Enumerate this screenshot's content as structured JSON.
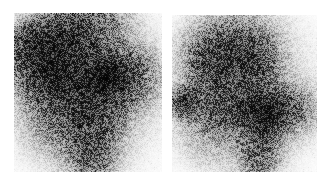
{
  "figure": {
    "kind": "nuclear-medicine-scintigraphy",
    "width": 329,
    "height": 184,
    "background_color": "#ffffff",
    "modality_label": "",
    "caption": ""
  },
  "panels": [
    {
      "id": "panel-left",
      "label": "",
      "view": "left",
      "x": 14,
      "y": 13,
      "width": 148,
      "height": 159,
      "base_color": "#f7f7f7",
      "speckle_color": "#1a1a1a",
      "noise_density": 0.55,
      "grain_size": 1,
      "blobs": [
        {
          "name": "upper-arc-band",
          "cx": 0.34,
          "cy": 0.13,
          "rx": 0.34,
          "ry": 0.16,
          "rot": -22,
          "intensity": 0.82
        },
        {
          "name": "upper-left-rim",
          "cx": 0.16,
          "cy": 0.26,
          "rx": 0.17,
          "ry": 0.22,
          "rot": -35,
          "intensity": 0.62
        },
        {
          "name": "central-mass",
          "cx": 0.47,
          "cy": 0.38,
          "rx": 0.27,
          "ry": 0.23,
          "rot": 10,
          "intensity": 0.74
        },
        {
          "name": "focal-hotspot",
          "cx": 0.62,
          "cy": 0.4,
          "rx": 0.11,
          "ry": 0.1,
          "rot": 0,
          "intensity": 1.0
        },
        {
          "name": "right-lateral-spread",
          "cx": 0.8,
          "cy": 0.4,
          "rx": 0.17,
          "ry": 0.17,
          "rot": 0,
          "intensity": 0.5
        },
        {
          "name": "mid-left-band",
          "cx": 0.22,
          "cy": 0.44,
          "rx": 0.18,
          "ry": 0.16,
          "rot": 0,
          "intensity": 0.45
        },
        {
          "name": "descending-column",
          "cx": 0.52,
          "cy": 0.7,
          "rx": 0.19,
          "ry": 0.26,
          "rot": 0,
          "intensity": 0.66
        },
        {
          "name": "lower-tail",
          "cx": 0.52,
          "cy": 0.92,
          "rx": 0.12,
          "ry": 0.12,
          "rot": 0,
          "intensity": 0.4
        },
        {
          "name": "lower-left-haze",
          "cx": 0.25,
          "cy": 0.7,
          "rx": 0.18,
          "ry": 0.18,
          "rot": 0,
          "intensity": 0.26
        },
        {
          "name": "body-background-haze",
          "cx": 0.46,
          "cy": 0.45,
          "rx": 0.46,
          "ry": 0.45,
          "rot": 0,
          "intensity": 0.22
        }
      ]
    },
    {
      "id": "panel-right",
      "label": "",
      "view": "right",
      "x": 172,
      "y": 15,
      "width": 145,
      "height": 157,
      "base_color": "#f7f7f7",
      "speckle_color": "#1a1a1a",
      "noise_density": 0.55,
      "grain_size": 1,
      "blobs": [
        {
          "name": "upper-central-mass",
          "cx": 0.4,
          "cy": 0.22,
          "rx": 0.21,
          "ry": 0.2,
          "rot": 0,
          "intensity": 0.66
        },
        {
          "name": "upper-right-limb",
          "cx": 0.56,
          "cy": 0.33,
          "rx": 0.17,
          "ry": 0.22,
          "rot": 15,
          "intensity": 0.56
        },
        {
          "name": "upper-left-limb",
          "cx": 0.24,
          "cy": 0.34,
          "rx": 0.15,
          "ry": 0.2,
          "rot": -15,
          "intensity": 0.5
        },
        {
          "name": "left-edge-focus",
          "cx": 0.08,
          "cy": 0.55,
          "rx": 0.08,
          "ry": 0.08,
          "rot": 0,
          "intensity": 0.96
        },
        {
          "name": "central-transverse-band",
          "cx": 0.42,
          "cy": 0.6,
          "rx": 0.28,
          "ry": 0.12,
          "rot": 0,
          "intensity": 0.62
        },
        {
          "name": "right-focal-hotspot",
          "cx": 0.66,
          "cy": 0.62,
          "rx": 0.13,
          "ry": 0.11,
          "rot": -10,
          "intensity": 1.0
        },
        {
          "name": "right-lateral-spread",
          "cx": 0.85,
          "cy": 0.6,
          "rx": 0.15,
          "ry": 0.15,
          "rot": 0,
          "intensity": 0.42
        },
        {
          "name": "descending-column",
          "cx": 0.6,
          "cy": 0.84,
          "rx": 0.14,
          "ry": 0.22,
          "rot": 0,
          "intensity": 0.6
        },
        {
          "name": "lower-left-haze",
          "cx": 0.25,
          "cy": 0.78,
          "rx": 0.18,
          "ry": 0.16,
          "rot": 0,
          "intensity": 0.2
        },
        {
          "name": "body-background-haze",
          "cx": 0.46,
          "cy": 0.48,
          "rx": 0.44,
          "ry": 0.45,
          "rot": 0,
          "intensity": 0.2
        }
      ]
    }
  ]
}
